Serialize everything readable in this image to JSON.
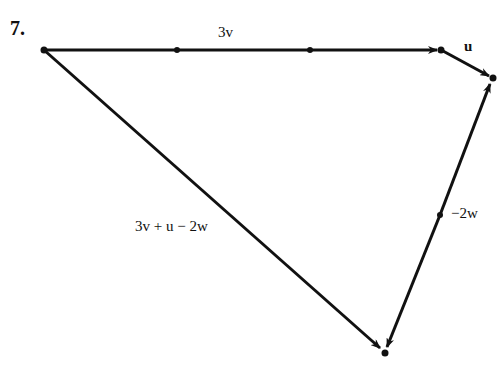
{
  "problem_number": "7.",
  "labels": {
    "three_v": "3v",
    "u": "u",
    "result": "3v + u − 2w",
    "minus_two_w": "−2w"
  },
  "points": {
    "start": [
      44,
      50
    ],
    "v1": [
      177,
      50
    ],
    "v2": [
      310,
      50
    ],
    "end_3v": [
      441,
      50
    ],
    "end_u": [
      493,
      78
    ],
    "mid_w": [
      440,
      215
    ],
    "end_result": [
      385,
      353
    ]
  },
  "colors": {
    "stroke": "#111111",
    "background": "#ffffff"
  }
}
